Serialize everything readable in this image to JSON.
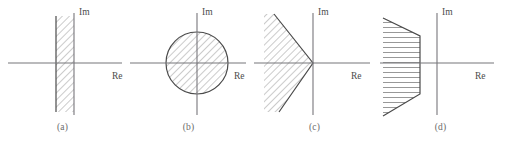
{
  "figure": {
    "type": "complex-plane-region-diagrams",
    "background_color": "#ffffff",
    "axis_color": "#77767b",
    "outline_color": "#4a4a4a",
    "hatch_color": "#8c8c8c",
    "label_color": "#4c4c4c",
    "caption_color": "#6a6a6a"
  },
  "panels": [
    {
      "id": "a",
      "caption": "(a)",
      "im_label": "Im",
      "re_label": "Re",
      "region": "vertical-strip-left-of-imaginary-axis",
      "origin": {
        "x": 74,
        "y": 63
      },
      "strip": {
        "x_left": 56,
        "x_right": 74,
        "y_top": 16,
        "y_bottom": 112
      }
    },
    {
      "id": "b",
      "caption": "(b)",
      "im_label": "Im",
      "re_label": "Re",
      "region": "disk-centered-at-origin",
      "origin": {
        "x": 71,
        "y": 63
      },
      "circle": {
        "cx": 71,
        "cy": 63,
        "r": 31
      }
    },
    {
      "id": "c",
      "caption": "(c)",
      "im_label": "Im",
      "re_label": "Re",
      "region": "sector-wedge-opening-left-from-origin",
      "origin": {
        "x": 61,
        "y": 63
      },
      "wedge": {
        "apex_x": 61,
        "apex_y": 63,
        "upper_tip_x": 22,
        "upper_tip_y": 14,
        "lower_tip_x": 27,
        "lower_tip_y": 112
      }
    },
    {
      "id": "d",
      "caption": "(d)",
      "im_label": "Im",
      "re_label": "Re",
      "region": "truncated-sector-wedge-left-of-vertical-cut",
      "origin": {
        "x": 59,
        "y": 63
      },
      "wedge": {
        "apex_x": 59,
        "apex_y": 63,
        "cut_x": 42,
        "upper_tip_x": 0,
        "upper_tip_y": 18,
        "lower_tip_x": 0,
        "lower_tip_y": 116
      }
    }
  ]
}
